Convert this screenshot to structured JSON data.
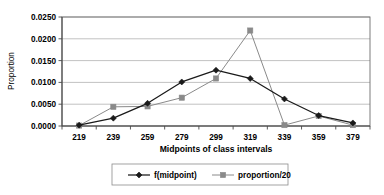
{
  "chart_data": {
    "type": "line",
    "title": "",
    "xlabel": "Midpoints of class intervals",
    "ylabel": "Proportion",
    "x": [
      219,
      239,
      259,
      279,
      299,
      319,
      339,
      359,
      379
    ],
    "categories": [
      "219",
      "239",
      "259",
      "279",
      "299",
      "319",
      "339",
      "359",
      "379"
    ],
    "series": [
      {
        "name": "f(midpoint)",
        "marker": "diamond",
        "color": "#1a1a1a",
        "values": [
          0.0002,
          0.0018,
          0.0052,
          0.0101,
          0.0128,
          0.0109,
          0.0062,
          0.0024,
          0.0007
        ]
      },
      {
        "name": "proportion/20",
        "marker": "square",
        "color": "#8a8a8a",
        "values": [
          0.0001,
          0.0044,
          0.0045,
          0.0065,
          0.0109,
          0.0219,
          0.0002,
          0.0023,
          0.0002
        ]
      }
    ],
    "ylim": [
      0.0,
      0.025
    ],
    "yticks": [
      0.0,
      0.005,
      0.01,
      0.015,
      0.02,
      0.025
    ],
    "ytick_labels": [
      "0.0000",
      "0.0050",
      "0.0100",
      "0.0150",
      "0.0200",
      "0.0250"
    ],
    "grid": true,
    "grid_axis": "y",
    "legend_position": "bottom"
  },
  "axes": {
    "y_title": "Proportion",
    "x_title": "Midpoints of class intervals"
  },
  "legend": {
    "entries": [
      {
        "label": "f(midpoint)"
      },
      {
        "label": "proportion/20"
      }
    ]
  },
  "colors": {
    "series_1": "#1a1a1a",
    "series_2": "#8a8a8a",
    "gridline": "#a8a8a8",
    "frame": "#6e6e6e",
    "background": "#ffffff"
  }
}
